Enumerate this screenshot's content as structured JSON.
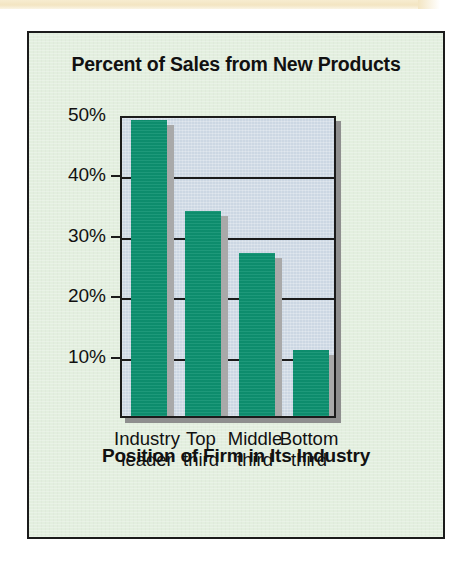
{
  "figure": {
    "card_bg": "#e3efdf",
    "border_color": "#1b1b1b",
    "paper_strip_color": "#f3e5c2"
  },
  "chart_data": {
    "type": "bar",
    "title": "Percent of Sales from New Products",
    "xlabel": "Position of Firm in Its Industry",
    "ylabel": "",
    "categories": [
      "Industry leader",
      "Top third",
      "Middle third",
      "Bottom third"
    ],
    "category_lines": [
      [
        "Industry",
        "leader"
      ],
      [
        "Top",
        "third"
      ],
      [
        "Middle",
        "third"
      ],
      [
        "Bottom",
        "third"
      ]
    ],
    "values": [
      49,
      34,
      27,
      11
    ],
    "value_labels": [
      "49%",
      "34%",
      "27%",
      "11%"
    ],
    "ylim": [
      0,
      50
    ],
    "yticks": [
      10,
      20,
      30,
      40,
      50
    ],
    "ytick_labels": [
      "10%",
      "20%",
      "30%",
      "40%",
      "50%"
    ],
    "grid": true,
    "legend": "none",
    "bar_color": "#0d9170",
    "bar_shadow_color": "#a9a9a9",
    "plot_bg": "#ccd7e3",
    "axis_color": "#1b1b1b"
  }
}
